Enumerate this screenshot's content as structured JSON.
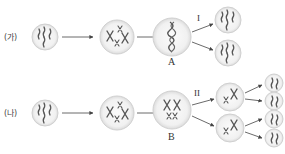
{
  "rows": [
    {
      "label": "(가)",
      "process_label": "I",
      "key_cell_label": "A",
      "type": "mitosis",
      "stages": [
        "parent cell (4 chromosomes)",
        "replicated chromosomes",
        "cell A (metaphase)",
        "2 daughter cells (4 chromosomes each)"
      ]
    },
    {
      "label": "(나)",
      "process_label": "II",
      "key_cell_label": "B",
      "type": "meiosis",
      "stages": [
        "parent cell (4 chromosomes)",
        "replicated chromosomes",
        "cell B (homologs paired)",
        "2 cells (2 chromosomes each)",
        "4 cells (2 chromosomes each)"
      ]
    }
  ],
  "colors": {
    "cell_fill": "#efefef",
    "cell_border": "#d4d4d4",
    "chromosome": "#555555",
    "arrow": "#444444"
  }
}
